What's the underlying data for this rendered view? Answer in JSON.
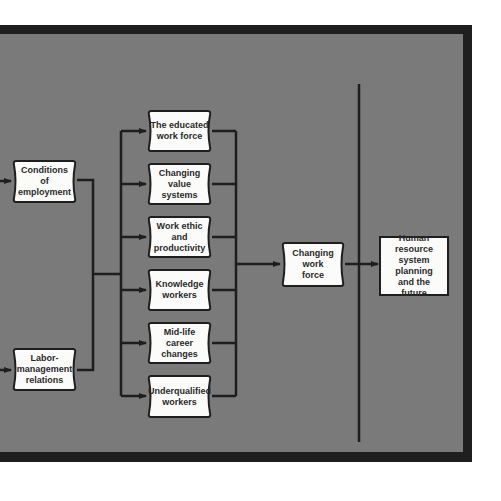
{
  "diagram": {
    "colors": {
      "panel": "#7a7a7a",
      "frame": "#1f1f1f",
      "box_fill": "#fbfbf9",
      "line": "#1e1e1e"
    },
    "sources": [
      {
        "id": "conditions",
        "label": "Conditions\nof\nemployment"
      },
      {
        "id": "labor",
        "label": "Labor-\nmanagement\nrelations"
      }
    ],
    "factors": [
      {
        "id": "educated",
        "label": "The educated\nwork force"
      },
      {
        "id": "values",
        "label": "Changing\nvalue\nsystems"
      },
      {
        "id": "ethic",
        "label": "Work ethic\nand\nproductivity"
      },
      {
        "id": "knowledge",
        "label": "Knowledge\nworkers"
      },
      {
        "id": "midlife",
        "label": "Mid-life\ncareer\nchanges"
      },
      {
        "id": "underqualified",
        "label": "Underqualified\nworkers"
      }
    ],
    "result": {
      "id": "changing-work-force",
      "label": "Changing\nwork\nforce"
    },
    "outcome": {
      "id": "hr-planning",
      "label": "Human resource\nsystem\nplanning\nand the\nfuture"
    }
  }
}
